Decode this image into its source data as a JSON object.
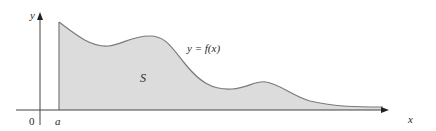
{
  "figure": {
    "axis_labels": {
      "x": "x",
      "y": "y"
    },
    "origin_label": "0",
    "a_label": "a",
    "region_label": "S",
    "curve_label": "y = f(x)",
    "colors": {
      "region_fill": "#dcdcdc",
      "curve_stroke": "#7a7a7a",
      "axis_stroke": "#444444",
      "text": "#2a2a2a"
    }
  }
}
